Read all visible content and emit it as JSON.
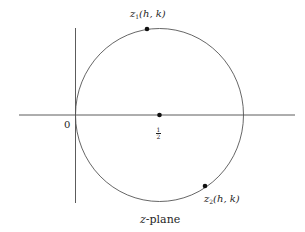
{
  "diagram": {
    "type": "complex-plane-circle",
    "caption": "z-plane",
    "caption_var": "z",
    "caption_rest": "-plane",
    "origin_label": "0",
    "center_label": {
      "numerator": "1",
      "denominator": "2"
    },
    "points": [
      {
        "id": "z1",
        "var": "z",
        "sub": "1",
        "args": "(h, k)"
      },
      {
        "id": "z2",
        "var": "z",
        "sub": "2",
        "args": "(h, k)"
      }
    ],
    "colors": {
      "stroke": "#4a4a4a",
      "point": "#111111",
      "text": "#1e1e1e",
      "background": "#ffffff"
    }
  }
}
